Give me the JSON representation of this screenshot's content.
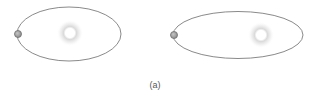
{
  "figure": {
    "caption": "(a)",
    "colors": {
      "orbit": "#8a8a8a",
      "planet_fill": "#a8a8a8",
      "planet_stroke": "#6e6e6e",
      "sun_core": "#ffffff",
      "sun_glow": "#d9d9d9",
      "background": "#ffffff"
    },
    "panels": [
      {
        "name": "left-orbit",
        "orbit": {
          "cx": 69,
          "cy": 34,
          "rx": 52,
          "ry": 27
        },
        "sun": {
          "cx": 70,
          "cy": 33,
          "r": 6
        },
        "planet": {
          "cx": 18,
          "cy": 34,
          "r": 3.5
        }
      },
      {
        "name": "right-orbit",
        "orbit": {
          "cx": 238,
          "cy": 35,
          "rx": 65,
          "ry": 23.5
        },
        "sun": {
          "cx": 261,
          "cy": 35,
          "r": 6
        },
        "planet": {
          "cx": 174,
          "cy": 35,
          "r": 3.5
        }
      }
    ]
  }
}
